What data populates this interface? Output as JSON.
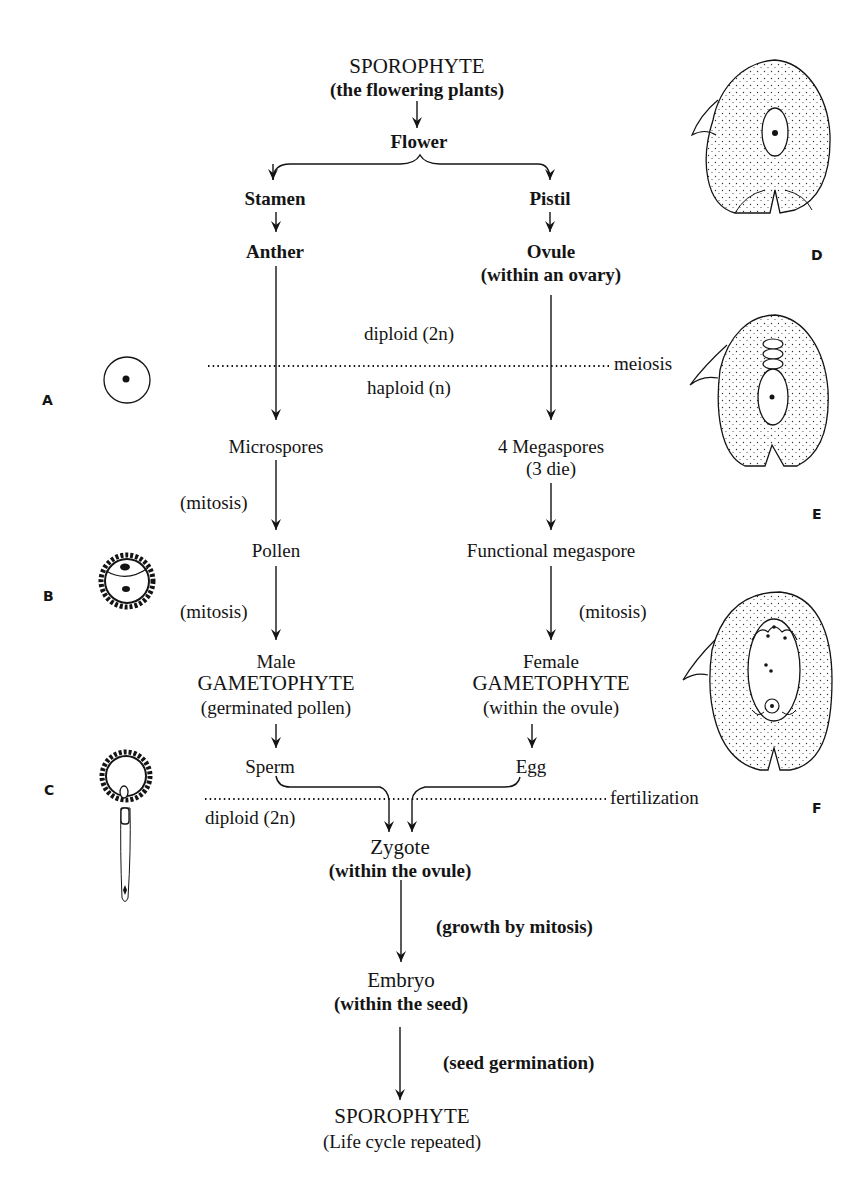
{
  "diagram": {
    "top": {
      "sporophyte": "SPOROPHYTE",
      "sporophyte_sub": "(the flowering plants)",
      "flower": "Flower"
    },
    "male_branch": {
      "stamen": "Stamen",
      "anther": "Anther",
      "microspores": "Microspores",
      "mitosis_1": "(mitosis)",
      "pollen": "Pollen",
      "mitosis_2": "(mitosis)",
      "gametophyte_1": "Male",
      "gametophyte_2": "GAMETOPHYTE",
      "gametophyte_3": "(germinated pollen)",
      "sperm": "Sperm"
    },
    "female_branch": {
      "pistil": "Pistil",
      "ovule": "Ovule",
      "ovule_sub": "(within an ovary)",
      "megaspores": "4 Megaspores",
      "megaspores_sub": "(3 die)",
      "functional": "Functional megaspore",
      "mitosis": "(mitosis)",
      "gametophyte_1": "Female",
      "gametophyte_2": "GAMETOPHYTE",
      "gametophyte_3": "(within the ovule)",
      "egg": "Egg"
    },
    "ploidy": {
      "diploid_top": "diploid (2n)",
      "meiosis": "meiosis",
      "haploid": "haploid (n)",
      "fertilization": "fertilization",
      "diploid_bottom": "diploid (2n)"
    },
    "bottom": {
      "zygote": "Zygote",
      "zygote_sub": "(within the ovule)",
      "growth": "(growth by mitosis)",
      "embryo": "Embryo",
      "embryo_sub": "(within the seed)",
      "germination": "(seed germination)",
      "sporophyte": "SPOROPHYTE",
      "sporophyte_sub": "(Life cycle repeated)"
    },
    "figure_labels": {
      "A": "A",
      "B": "B",
      "C": "C",
      "D": "D",
      "E": "E",
      "F": "F"
    }
  }
}
